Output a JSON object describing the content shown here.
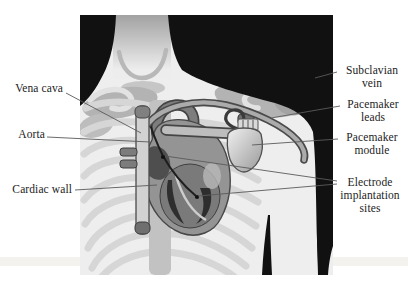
{
  "figure": {
    "labels_left": [
      {
        "text": "Vena cava"
      },
      {
        "text": "Aorta"
      },
      {
        "text": "Cardiac wall"
      }
    ],
    "labels_right": [
      {
        "text": "Subclavian vein"
      },
      {
        "text": "Pacemaker leads"
      },
      {
        "text": "Pacemaker module"
      },
      {
        "text": "Electrode implantation sites"
      }
    ],
    "colors": {
      "page_background": "#ffffff",
      "silhouette_black": "#111111",
      "skin": "#eeeeee",
      "neck_shadow": "#a2a2a2",
      "collar": "#b8b8b8",
      "rib": "#d6d6d6",
      "sternum": "#c2c2c2",
      "muscle_shading": "#b3b3b3",
      "heart_fill": "#949494",
      "heart_outline": "#474747",
      "chamber_dark": "#2e2e2e",
      "vena_cava_tube": "#d2d2d2",
      "lead_tube": "#ababab",
      "module_light": "#f0f0f0",
      "module_dark": "#9a9a9a",
      "leader_line": "#5a5a5a",
      "label_text": "#1c1c1c"
    }
  }
}
